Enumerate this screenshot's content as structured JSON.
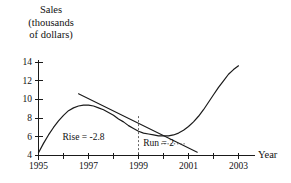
{
  "chart_data": {
    "type": "line",
    "title": "",
    "ylabel_lines": [
      "Sales",
      "(thousands",
      "of dollars)"
    ],
    "ylabel": "Sales (thousands of dollars)",
    "xlabel": "Year",
    "xlim": [
      1995,
      2003.3
    ],
    "ylim": [
      4,
      14.6
    ],
    "grid": false,
    "legend": "none",
    "y_ticks": [
      4,
      6,
      8,
      10,
      12,
      14
    ],
    "y_tick_labels": [
      "4",
      "6",
      "8",
      "10",
      "12",
      "14"
    ],
    "x_ticks": [
      1995,
      1996,
      1997,
      1998,
      1999,
      2000,
      2001,
      2002,
      2003
    ],
    "x_tick_labels": [
      "1995",
      "",
      "1997",
      "",
      "1999",
      "",
      "2001",
      "",
      "2003"
    ],
    "x_labeled_ticks": [
      {
        "x": 1995,
        "label": "1995"
      },
      {
        "x": 1997,
        "label": "1997"
      },
      {
        "x": 1999,
        "label": "1999"
      },
      {
        "x": 2001,
        "label": "2001"
      },
      {
        "x": 2003,
        "label": "2003"
      }
    ],
    "series": [
      {
        "name": "sales-curve",
        "type": "line",
        "color": "#1a1a1a",
        "x": [
          1995.0,
          1995.2,
          1995.4,
          1995.6,
          1995.8,
          1996.0,
          1996.2,
          1996.4,
          1996.6,
          1996.8,
          1997.0,
          1997.2,
          1997.4,
          1997.6,
          1997.8,
          1998.0,
          1998.2,
          1998.4,
          1998.6,
          1998.8,
          1999.0,
          1999.2,
          1999.4,
          1999.6,
          1999.8,
          2000.0,
          2000.2,
          2000.4,
          2000.6,
          2000.8,
          2001.0,
          2001.2,
          2001.4,
          2001.6,
          2001.8,
          2002.0,
          2002.2,
          2002.4,
          2002.6,
          2002.8,
          2003.0
        ],
        "y": [
          4.3,
          5.3,
          6.2,
          7.0,
          7.7,
          8.3,
          8.8,
          9.1,
          9.3,
          9.4,
          9.4,
          9.3,
          9.1,
          8.9,
          8.6,
          8.3,
          7.9,
          7.6,
          7.2,
          6.9,
          6.6,
          6.4,
          6.3,
          6.2,
          6.1,
          6.1,
          6.1,
          6.2,
          6.4,
          6.7,
          7.1,
          7.6,
          8.2,
          8.9,
          9.7,
          10.5,
          11.3,
          12.0,
          12.7,
          13.2,
          13.6
        ]
      },
      {
        "name": "tangent-line",
        "type": "line",
        "color": "#1a1a1a",
        "x": [
          1996.6,
          2001.35
        ],
        "y": [
          10.6,
          4.35
        ],
        "note": "straight secant/tangent line through the curve"
      }
    ],
    "annotations": [
      {
        "name": "rise-label",
        "text": "Rise = -2.8",
        "x": 1998.0,
        "y": 5.85
      },
      {
        "name": "run-label",
        "text": "Run = 2",
        "x": 1999.15,
        "y": 5.2
      },
      {
        "name": "rise-guide",
        "type": "dashed-vertical",
        "x": 1999.0,
        "y0": 4.15,
        "y1": 8.35
      },
      {
        "name": "run-guide",
        "type": "dotted-horizontal",
        "x0": 1999.9,
        "x1": 2000.9,
        "y": 5.25
      }
    ]
  },
  "figure": {
    "background": "#ffffff",
    "ink": "#1a1a1a"
  }
}
